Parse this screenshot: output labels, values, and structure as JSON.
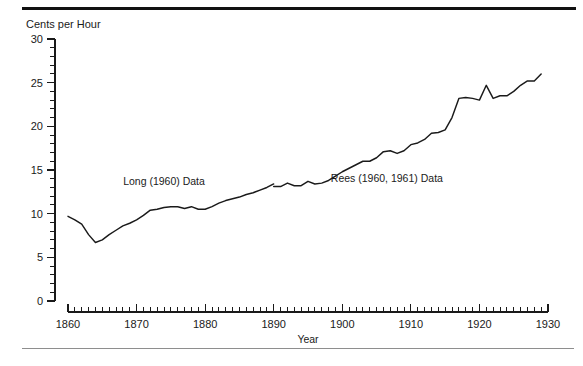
{
  "figure": {
    "top_rule_color": "#111111",
    "bottom_rule_color": "#8e8e8e",
    "background": "#ffffff"
  },
  "chart_data": {
    "type": "line",
    "title": "",
    "subtitle": "",
    "xlabel": "Year",
    "ylabel": "Cents per Hour",
    "xlim": [
      1860,
      1930
    ],
    "ylim": [
      0,
      30
    ],
    "grid": false,
    "legend_position": "inline-annotation",
    "x_major_ticks": [
      1860,
      1870,
      1880,
      1890,
      1900,
      1910,
      1920,
      1930
    ],
    "x_major_tick_labels": [
      "1860",
      "1870",
      "1880",
      "1890",
      "1900",
      "1910",
      "1920",
      "1930"
    ],
    "x_minor_tick_step": 1,
    "y_major_ticks": [
      0,
      5,
      10,
      15,
      20,
      25,
      30
    ],
    "y_major_tick_labels": [
      "0",
      "5",
      "10",
      "15",
      "20",
      "25",
      "30"
    ],
    "y_minor_tick_step": 1,
    "line_color": "#1a1a1a",
    "annotations": [
      {
        "text": "Long (1960) Data",
        "x": 1874.0,
        "y": 13.3
      },
      {
        "text": "Rees (1960, 1961) Data",
        "x": 1906.5,
        "y": 13.6
      }
    ],
    "series": [
      {
        "name": "Long (1960) Data",
        "x": [
          1860,
          1861,
          1862,
          1863,
          1864,
          1865,
          1866,
          1867,
          1868,
          1869,
          1870,
          1871,
          1872,
          1873,
          1874,
          1875,
          1876,
          1877,
          1878,
          1879,
          1880,
          1881,
          1882,
          1883,
          1884,
          1885,
          1886,
          1887,
          1888,
          1889,
          1890
        ],
        "values": [
          9.7,
          9.3,
          8.8,
          7.6,
          6.7,
          7.0,
          7.6,
          8.1,
          8.6,
          8.9,
          9.3,
          9.8,
          10.4,
          10.5,
          10.7,
          10.8,
          10.8,
          10.6,
          10.8,
          10.5,
          10.5,
          10.8,
          11.2,
          11.5,
          11.7,
          11.9,
          12.2,
          12.4,
          12.7,
          13.0,
          13.4
        ]
      },
      {
        "name": "Rees (1960, 1961) Data",
        "x": [
          1890,
          1891,
          1892,
          1893,
          1894,
          1895,
          1896,
          1897,
          1898,
          1899,
          1900,
          1901,
          1902,
          1903,
          1904,
          1905,
          1906,
          1907,
          1908,
          1909,
          1910,
          1911,
          1912,
          1913,
          1914,
          1915,
          1916,
          1917,
          1918,
          1919,
          1920,
          1921,
          1922,
          1923,
          1924,
          1925,
          1926,
          1927,
          1928,
          1929
        ],
        "values": [
          13.1,
          13.1,
          13.5,
          13.2,
          13.2,
          13.7,
          13.4,
          13.5,
          13.8,
          14.3,
          14.8,
          15.2,
          15.6,
          16.0,
          16.0,
          16.4,
          17.1,
          17.2,
          16.9,
          17.2,
          17.9,
          18.1,
          18.5,
          19.2,
          19.3,
          19.6,
          21.0,
          23.2,
          23.3,
          23.2,
          23.0,
          24.7,
          23.2,
          23.5,
          23.5,
          24.0,
          24.7,
          25.2,
          25.2,
          26.0
        ]
      }
    ]
  }
}
